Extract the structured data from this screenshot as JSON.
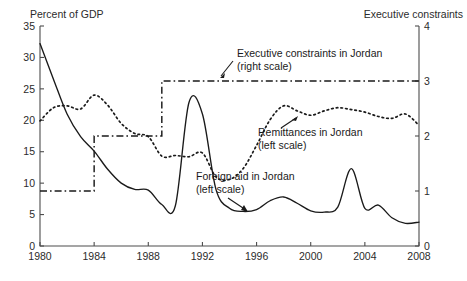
{
  "chart_data": {
    "type": "line",
    "title": "",
    "xlabel": "",
    "ylabel": "Percent of GDP",
    "y2label": "Executive constraints",
    "xlim": [
      1980,
      2008
    ],
    "ylim": [
      0,
      35
    ],
    "y2lim": [
      0,
      4
    ],
    "grid": false,
    "legend_position": "inline-annotations",
    "xticks": [
      1980,
      1984,
      1988,
      1992,
      1996,
      2000,
      2004,
      2008
    ],
    "xticklabels": [
      "1980",
      "1984",
      "1988",
      "1992",
      "1996",
      "2000",
      "2004",
      "2008"
    ],
    "yticks": [
      0,
      5,
      10,
      15,
      20,
      25,
      30,
      35
    ],
    "yticklabels": [
      "0",
      "5",
      "10",
      "15",
      "20",
      "25",
      "30",
      "35"
    ],
    "y2ticks": [
      0,
      1,
      2,
      3,
      4
    ],
    "y2ticklabels": [
      "0",
      "1",
      "2",
      "3",
      "4"
    ],
    "series": [
      {
        "name": "Foreign aid in Jordan",
        "scale": "left",
        "style": "solid",
        "label_line1": "Foreign aid in Jordan",
        "label_line2": "(left scale)",
        "x": [
          1980,
          1981,
          1982,
          1983,
          1984,
          1985,
          1986,
          1987,
          1988,
          1989,
          1990,
          1991,
          1992,
          1993,
          1994,
          1995,
          1996,
          1997,
          1998,
          1999,
          2000,
          2001,
          2002,
          2003,
          2004,
          2005,
          2006,
          2007,
          2008
        ],
        "y": [
          32.2,
          26.5,
          21.0,
          17.4,
          15.1,
          12.2,
          10.0,
          9.0,
          8.9,
          6.6,
          6.4,
          22.8,
          21.0,
          9.0,
          6.0,
          5.5,
          5.8,
          7.2,
          7.8,
          6.8,
          5.6,
          5.4,
          6.2,
          12.3,
          6.0,
          6.5,
          4.5,
          3.6,
          3.8
        ]
      },
      {
        "name": "Remittances in Jordan",
        "scale": "left",
        "style": "dotted",
        "label_line1": "Remittances in Jordan",
        "label_line2": "(left scale)",
        "x": [
          1980,
          1981,
          1982,
          1983,
          1984,
          1985,
          1986,
          1987,
          1988,
          1989,
          1990,
          1991,
          1992,
          1993,
          1994,
          1995,
          1996,
          1997,
          1998,
          1999,
          2000,
          2001,
          2002,
          2003,
          2004,
          2005,
          2006,
          2007,
          2008
        ],
        "y": [
          19.9,
          22.0,
          22.3,
          21.8,
          24.0,
          22.4,
          19.5,
          17.9,
          17.4,
          14.3,
          14.4,
          14.2,
          14.8,
          11.0,
          10.6,
          12.3,
          16.0,
          20.1,
          22.3,
          21.5,
          20.8,
          21.5,
          22.0,
          21.7,
          21.3,
          20.6,
          20.3,
          21.0,
          19.2
        ]
      },
      {
        "name": "Executive constraints in Jordan",
        "scale": "right",
        "style": "dashdot",
        "label_line1": "Executive constraints in Jordan",
        "label_line2": "(right scale)",
        "x": [
          1980,
          1981,
          1982,
          1983,
          1984,
          1985,
          1986,
          1987,
          1988,
          1989,
          1990,
          1991,
          1992,
          1993,
          1994,
          1995,
          1996,
          1997,
          1998,
          1999,
          2000,
          2001,
          2002,
          2003,
          2004,
          2005,
          2006,
          2007,
          2008
        ],
        "y": [
          1,
          1,
          1,
          1,
          2,
          2,
          2,
          2,
          2,
          3,
          3,
          3,
          3,
          3,
          3,
          3,
          3,
          3,
          3,
          3,
          3,
          3,
          3,
          3,
          3,
          3,
          3,
          3,
          3
        ]
      }
    ]
  }
}
